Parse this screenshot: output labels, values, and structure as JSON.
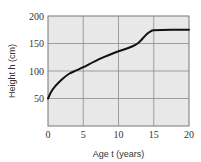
{
  "chart_data": {
    "type": "line",
    "title": "",
    "xlabel": "Age t (years)",
    "ylabel": "Height h (cm)",
    "xlim": [
      0,
      20
    ],
    "ylim": [
      0,
      200
    ],
    "x_ticks": [
      0,
      5,
      10,
      15,
      20
    ],
    "y_ticks": [
      50,
      100,
      150,
      200
    ],
    "x_tick_labels": [
      "0",
      "5",
      "10",
      "15",
      "20"
    ],
    "y_tick_labels": [
      "50",
      "100",
      "150",
      "200"
    ],
    "grid": true,
    "legend": null,
    "series": [
      {
        "name": "Height",
        "x": [
          0,
          0.5,
          1,
          2,
          3,
          4,
          5,
          7.5,
          10,
          11,
          12,
          12.7,
          13.2,
          13.7,
          14.2,
          14.7,
          15,
          17.5,
          20
        ],
        "values": [
          50,
          63,
          72,
          85,
          95,
          101,
          107,
          123,
          136,
          140,
          145,
          150,
          156,
          163,
          169,
          173,
          174,
          175,
          175
        ]
      }
    ]
  },
  "style": {
    "plot_background": "#e8e8e8",
    "grid_color": "#8a8a8a",
    "line_color": "#111111",
    "border_color": "#777777"
  }
}
